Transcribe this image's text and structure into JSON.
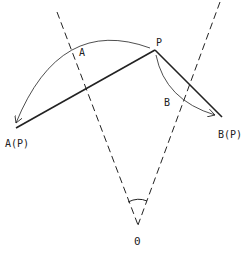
{
  "labels": {
    "p": "P",
    "a": "A",
    "b": "B",
    "ap": "A(P)",
    "bp": "B(P)",
    "o": "0"
  },
  "colors": {
    "stroke": "#222222",
    "background": "#ffffff"
  }
}
